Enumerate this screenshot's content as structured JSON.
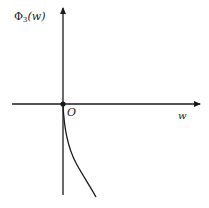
{
  "diagram": {
    "y_axis_label": {
      "symbol": "Φ",
      "subscript": "3",
      "argument": "(w)"
    },
    "x_axis_label": "w",
    "origin_label": "O",
    "colors": {
      "stroke": "#1a1a1a",
      "background": "#ffffff"
    },
    "geometry": {
      "origin": [
        63,
        104
      ],
      "x_axis": {
        "from": [
          12,
          104
        ],
        "to": [
          200,
          104
        ]
      },
      "y_axis": {
        "from": [
          63,
          195
        ],
        "to": [
          63,
          8
        ]
      },
      "curve": {
        "description": "curve starting at origin, descending down-right",
        "from": [
          63,
          104
        ],
        "to": [
          96,
          197
        ]
      }
    }
  }
}
